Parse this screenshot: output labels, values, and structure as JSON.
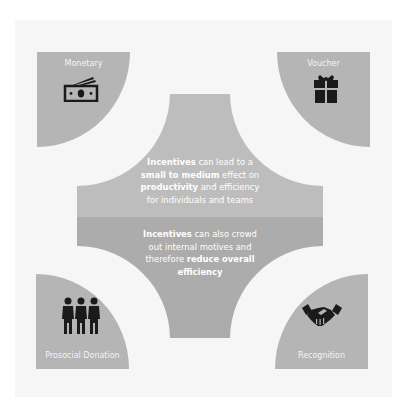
{
  "colors": {
    "panel_bg": "#f6f6f6",
    "quadrant_fill": "#b5b5b5",
    "center_top_fill": "#bdbdbd",
    "center_bottom_fill": "#acacac",
    "icon_color": "#1a1a1a",
    "text_color": "#ffffff"
  },
  "quadrants": [
    {
      "position": "top-left",
      "label": "Monetary",
      "icon": "banknote-icon"
    },
    {
      "position": "top-right",
      "label": "Voucher",
      "icon": "gift-icon"
    },
    {
      "position": "bottom-left",
      "label": "Prosocial Donation",
      "icon": "people-group-icon"
    },
    {
      "position": "bottom-right",
      "label": "Recognition",
      "icon": "handshake-icon"
    }
  ],
  "center": {
    "top_block": {
      "p1_bold": "Incentives",
      "p1_rest": " can lead to a",
      "p2_bold": "small to medium",
      "p2_rest": " effect on",
      "p3_bold": "productivity",
      "p3_rest": " and efficiency",
      "p4": "for individuals and teams"
    },
    "bottom_block": {
      "p1_bold": "Incentives",
      "p1_rest": " can also crowd",
      "p2": "out internal motives and",
      "p3_pre": "therefore ",
      "p3_bold": "reduce overall",
      "p4_bold": "efficiency"
    }
  }
}
